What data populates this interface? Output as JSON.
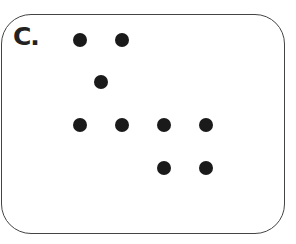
{
  "panel": {
    "label": "C.",
    "dot_color": "#1a1a1a",
    "border_color": "#444444",
    "dots": [
      {
        "x": 80,
        "y": 40
      },
      {
        "x": 122,
        "y": 40
      },
      {
        "x": 101,
        "y": 82
      },
      {
        "x": 80,
        "y": 125
      },
      {
        "x": 122,
        "y": 125
      },
      {
        "x": 164,
        "y": 125
      },
      {
        "x": 206,
        "y": 125
      },
      {
        "x": 164,
        "y": 168
      },
      {
        "x": 206,
        "y": 168
      }
    ]
  }
}
